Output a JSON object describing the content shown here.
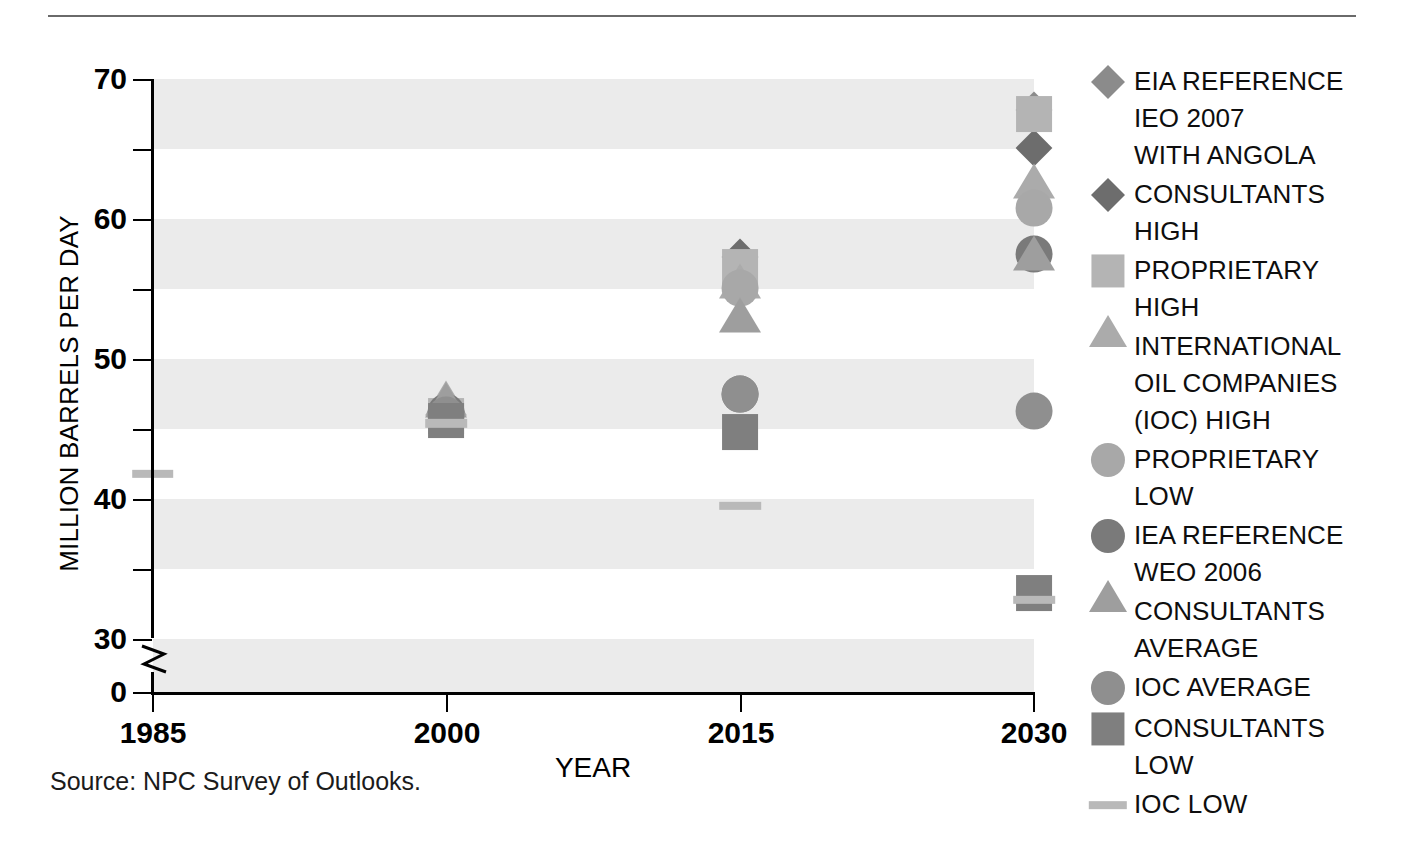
{
  "chart_data": {
    "type": "scatter",
    "title": "",
    "xlabel": "YEAR",
    "ylabel": "MILLION BARRELS PER DAY",
    "xlim": [
      1985,
      2030
    ],
    "ylim": [
      0,
      70
    ],
    "y_ticks_major": [
      70,
      60,
      50,
      40,
      30,
      0
    ],
    "y_ticks_minor": [
      65,
      55,
      45,
      35
    ],
    "x_ticks": [
      1985,
      2000,
      2015,
      2030
    ],
    "axis_break": "between 30 and 0",
    "grid": "horizontal banded shading",
    "legend_position": "right",
    "source": "Source:  NPC Survey of Outlooks.",
    "series": [
      {
        "name": "EIA REFERENCE IEO 2007 WITH ANGOLA",
        "marker": "diamond",
        "color": "#8b8b8b",
        "points": [
          {
            "x": 2000,
            "y": 46.3
          },
          {
            "x": 2030,
            "y": 67.8
          }
        ]
      },
      {
        "name": "CONSULTANTS HIGH",
        "marker": "diamond",
        "color": "#6d6d6d",
        "points": [
          {
            "x": 2000,
            "y": 46.2
          },
          {
            "x": 2015,
            "y": 57.3
          },
          {
            "x": 2030,
            "y": 65.1
          }
        ]
      },
      {
        "name": "PROPRIETARY HIGH",
        "marker": "square",
        "color": "#b4b4b4",
        "points": [
          {
            "x": 2000,
            "y": 45.9
          },
          {
            "x": 2015,
            "y": 56.6
          },
          {
            "x": 2030,
            "y": 67.5
          }
        ]
      },
      {
        "name": "INTERNATIONAL OIL COMPANIES (IOC) HIGH",
        "marker": "triangle",
        "color": "#ababab",
        "points": [
          {
            "x": 2000,
            "y": 46.0
          },
          {
            "x": 2015,
            "y": 54.3
          },
          {
            "x": 2030,
            "y": 61.5
          }
        ]
      },
      {
        "name": "PROPRIETARY LOW",
        "marker": "circle",
        "color": "#a8a8a8",
        "points": [
          {
            "x": 2000,
            "y": 46.1
          },
          {
            "x": 2015,
            "y": 55.1
          },
          {
            "x": 2030,
            "y": 60.8
          }
        ]
      },
      {
        "name": "IEA REFERENCE WEO 2006",
        "marker": "circle",
        "color": "#7a7a7a",
        "points": [
          {
            "x": 2000,
            "y": 46.2
          },
          {
            "x": 2015,
            "y": 47.5
          },
          {
            "x": 2030,
            "y": 57.5
          }
        ]
      },
      {
        "name": "CONSULTANTS AVERAGE",
        "marker": "triangle",
        "color": "#9e9e9e",
        "points": [
          {
            "x": 2000,
            "y": 45.8
          },
          {
            "x": 2015,
            "y": 51.9
          },
          {
            "x": 2030,
            "y": 56.3
          }
        ]
      },
      {
        "name": "IOC AVERAGE",
        "marker": "circle",
        "color": "#8f8f8f",
        "points": [
          {
            "x": 2000,
            "y": 46.0
          },
          {
            "x": 2015,
            "y": 47.5
          },
          {
            "x": 2030,
            "y": 46.3
          }
        ]
      },
      {
        "name": "CONSULTANTS LOW",
        "marker": "square",
        "color": "#7f7f7f",
        "points": [
          {
            "x": 2000,
            "y": 45.6
          },
          {
            "x": 2015,
            "y": 44.8
          },
          {
            "x": 2030,
            "y": 33.3
          }
        ]
      },
      {
        "name": "IOC LOW",
        "marker": "dash",
        "color": "#b9b9b9",
        "points": [
          {
            "x": 1985,
            "y": 41.8
          },
          {
            "x": 2000,
            "y": 45.4
          },
          {
            "x": 2015,
            "y": 39.5
          },
          {
            "x": 2030,
            "y": 32.8
          }
        ]
      }
    ]
  },
  "axis": {
    "y_title": "MILLION BARRELS PER DAY",
    "x_title": "YEAR",
    "y_ticks": [
      "70",
      "60",
      "50",
      "40",
      "30",
      "0"
    ],
    "x_ticks": [
      "1985",
      "2000",
      "2015",
      "2030"
    ]
  },
  "legend": {
    "items": [
      {
        "label": "EIA REFERENCE\nIEO 2007\nWITH ANGOLA",
        "marker": "diamond",
        "color": "#8b8b8b",
        "icon": "diamond-marker-icon"
      },
      {
        "label": "CONSULTANTS\nHIGH",
        "marker": "diamond",
        "color": "#6d6d6d",
        "icon": "diamond-marker-icon"
      },
      {
        "label": "PROPRIETARY\nHIGH",
        "marker": "square",
        "color": "#b4b4b4",
        "icon": "square-marker-icon"
      },
      {
        "label": "INTERNATIONAL\nOIL COMPANIES\n(IOC) HIGH",
        "marker": "triangle",
        "color": "#ababab",
        "icon": "triangle-marker-icon"
      },
      {
        "label": "PROPRIETARY\nLOW",
        "marker": "circle",
        "color": "#a8a8a8",
        "icon": "circle-marker-icon"
      },
      {
        "label": "IEA REFERENCE\nWEO 2006",
        "marker": "circle",
        "color": "#7a7a7a",
        "icon": "circle-marker-icon"
      },
      {
        "label": "CONSULTANTS\nAVERAGE",
        "marker": "triangle",
        "color": "#9e9e9e",
        "icon": "triangle-marker-icon"
      },
      {
        "label": "IOC AVERAGE",
        "marker": "circle",
        "color": "#8f8f8f",
        "icon": "circle-marker-icon"
      },
      {
        "label": "CONSULTANTS\nLOW",
        "marker": "square",
        "color": "#7f7f7f",
        "icon": "square-marker-icon"
      },
      {
        "label": "IOC LOW",
        "marker": "dash",
        "color": "#b9b9b9",
        "icon": "dash-marker-icon"
      }
    ]
  },
  "footer": {
    "source": "Source:  NPC Survey of Outlooks."
  },
  "colors": {
    "band": "#ebebeb",
    "axis": "#000000",
    "rule": "#6a6a6a"
  }
}
